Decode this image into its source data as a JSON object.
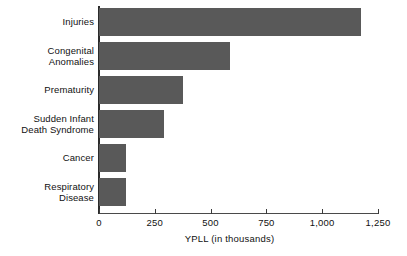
{
  "chart_data": {
    "type": "bar",
    "orientation": "horizontal",
    "title": "",
    "xlabel": "YPLL (in thousands)",
    "ylabel": "",
    "xlim": [
      0,
      1250
    ],
    "xticks": [
      0,
      250,
      500,
      750,
      1000,
      1250
    ],
    "xtick_labels": [
      "0",
      "250",
      "500",
      "750",
      "1,000",
      "1,250"
    ],
    "grid": false,
    "legend": null,
    "bar_color": "#595959",
    "axis_color": "#2b2b2b",
    "categories": [
      "Injuries",
      "Congenital\nAnomalies",
      "Prematurity",
      "Sudden Infant\nDeath Syndrome",
      "Cancer",
      "Respiratory\nDisease"
    ],
    "values": [
      1175,
      585,
      375,
      290,
      120,
      120
    ]
  }
}
